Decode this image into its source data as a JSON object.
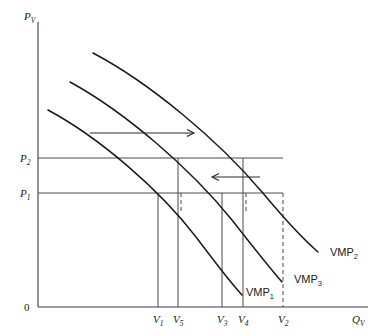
{
  "figure": {
    "title": "",
    "background_color": "#ffffff",
    "line_color": "#1a1a1a",
    "guide_color": "#4a4a4a"
  },
  "axes": {
    "y_axis": {
      "label": "P",
      "subscript": "V",
      "x": 38,
      "top": 22,
      "bottom": 307
    },
    "x_axis": {
      "label": "Q",
      "subscript": "V",
      "y": 307,
      "left": 38,
      "right": 368
    },
    "origin_label": "0"
  },
  "price_levels": [
    {
      "label": "P",
      "subscript": "2",
      "y": 158,
      "x_end": 283
    },
    {
      "label": "P",
      "subscript": "1",
      "y": 193,
      "x_end": 283
    }
  ],
  "quantity_ticks": [
    {
      "label": "V",
      "subscript": "1",
      "x": 158,
      "style": "solid",
      "top": 193
    },
    {
      "label": "V",
      "subscript": "5",
      "x": 178,
      "style": "solid",
      "top": 158
    },
    {
      "label": "V",
      "subscript": "3",
      "x": 222,
      "style": "solid",
      "top": 193
    },
    {
      "label": "V",
      "subscript": "4",
      "x": 243,
      "style": "solid",
      "top": 158
    },
    {
      "label": "V",
      "subscript": "2",
      "x": 283,
      "style": "dashed",
      "top": 193
    }
  ],
  "curves": [
    {
      "name": "VMP",
      "subscript": "1",
      "label_x": 246,
      "label_y": 296,
      "path": "M 48 110 C 100 138, 160 190, 196 237 C 212 258, 228 280, 242 295"
    },
    {
      "name": "VMP",
      "subscript": "3",
      "label_x": 294,
      "label_y": 283,
      "path": "M 70 82 C 125 112, 190 168, 232 220 C 250 243, 268 266, 282 282"
    },
    {
      "name": "VMP",
      "subscript": "2",
      "label_x": 330,
      "label_y": 256,
      "path": "M 93 53 C 150 83, 218 140, 262 192 C 282 216, 302 238, 318 252"
    }
  ],
  "arrows": [
    {
      "name": "shift-right-arrow",
      "direction": "right",
      "x_start": 90,
      "x_end": 194,
      "y": 133
    },
    {
      "name": "shift-left-arrow",
      "direction": "left",
      "x_start": 260,
      "x_end": 212,
      "y": 177
    }
  ]
}
